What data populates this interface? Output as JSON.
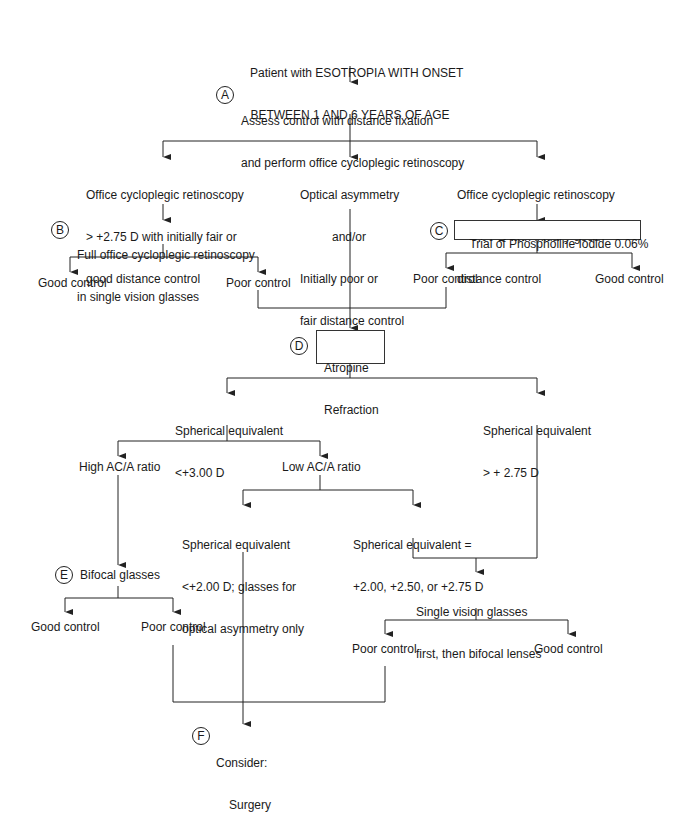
{
  "title": {
    "line1": "Patient with ESOTROPIA WITH ONSET",
    "line2": "BETWEEN 1 AND 6 YEARS OF AGE"
  },
  "nodes": {
    "A": {
      "marker": "A",
      "line1": "Assess control with distance fixation",
      "line2": "and perform office cycloplegic retinoscopy"
    },
    "left_condition": {
      "line1": "Office cycloplegic retinoscopy",
      "line2": "> +2.75 D with initially fair or",
      "line3": "good distance control"
    },
    "middle_condition": {
      "line1": "Optical asymmetry",
      "line2": "and/or",
      "line3": "Initially poor or",
      "line4": "fair distance control"
    },
    "right_condition": {
      "line1": "Office cycloplegic retinoscopy",
      "line2": "<+3.00 D with initially good",
      "line3": "distance control"
    },
    "B": {
      "marker": "B",
      "line1": "Full office cycloplegic retinoscopy",
      "line2": "in single vision glasses"
    },
    "C": {
      "marker": "C",
      "label": "Trial of Phospholine Iodide 0.06%"
    },
    "B_good": "Good control",
    "B_poor": "Poor control",
    "C_poor": "Poor control",
    "C_good": "Good control",
    "D": {
      "marker": "D",
      "line1": "Atropine",
      "line2": "Refraction"
    },
    "se_low": {
      "line1": "Spherical equivalent",
      "line2": "<+3.00 D"
    },
    "se_high": {
      "line1": "Spherical equivalent",
      "line2": "> + 2.75 D"
    },
    "high_aca": "High AC/A ratio",
    "low_aca": "Low AC/A ratio",
    "se_lt2": {
      "line1": "Spherical equivalent",
      "line2": "<+2.00 D; glasses for",
      "line3": "optical asymmetry only"
    },
    "se_eq": {
      "line1": "Spherical equivalent =",
      "line2": "+2.00, +2.50, or +2.75 D"
    },
    "E": {
      "marker": "E",
      "label": "Bifocal glasses"
    },
    "E_good": "Good control",
    "E_poor": "Poor control",
    "single_vision": {
      "line1": "Single vision glasses",
      "line2": "first, then bifocal lenses"
    },
    "SV_poor": "Poor control",
    "SV_good": "Good control",
    "F": {
      "marker": "F",
      "line1": "Consider:",
      "line2": "Surgery"
    }
  },
  "colors": {
    "line": "#222222",
    "text": "#1a1a1a",
    "background": "#ffffff"
  }
}
